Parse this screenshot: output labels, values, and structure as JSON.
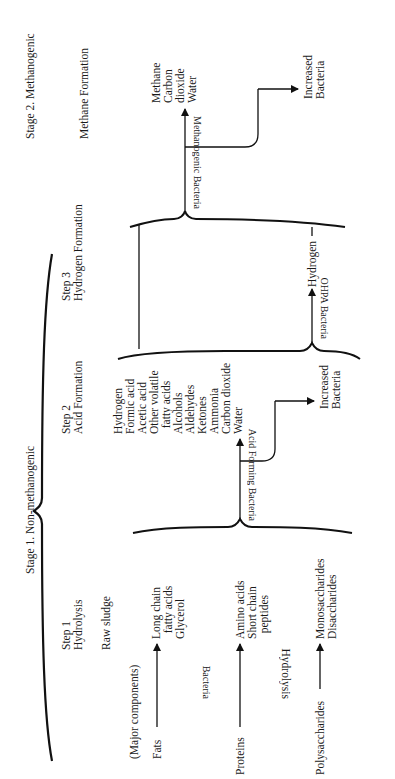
{
  "stages": {
    "stage1": "Stage 1. Non-methanogenic",
    "stage2": "Stage 2. Methanogenic"
  },
  "steps": {
    "step1": {
      "label": "Step 1",
      "name": "Hydrolysis"
    },
    "step2": {
      "label": "Step 2",
      "name": "Acid Formation"
    },
    "step3": {
      "label": "Step 3",
      "name": "Hydrogen Formation"
    },
    "methane": {
      "name": "Methane Formation"
    }
  },
  "inputs": {
    "raw_sludge": "Raw sludge",
    "major_components": "(Major components)",
    "fats": "Fats",
    "proteins": "Proteins",
    "polysaccharides": "Polysaccharides"
  },
  "hydrolysis_products": {
    "fats": "Long chain\n  fatty acids\nGlycerol",
    "proteins": "Amino acids\nShort chain\n  peptides",
    "polysaccharides": "Monosaccharides\nDisaccharides"
  },
  "hydrolysis_label": {
    "bacteria": "Bacteria",
    "hydrolysis": "Hydrolysis"
  },
  "acid_products": "Hydrogen\nFormic acid\nAcetic acid\nOther volatile\n  fatty acids\nAlcohols\nAldehydes\nKetones\nAmmonia\nCarbon dioxide\nWater",
  "bacteria_labels": {
    "acid_forming": "Acid Forming Bacteria",
    "ohpa": "OHPA Bacteria",
    "methanogenic": "Methanogenic Bacteria"
  },
  "hydrogen_output": "Hydrogen",
  "methane_products": "Methane\nCarbon\ndioxide\nWater",
  "increased_bacteria_1": "Increased\nBacteria",
  "increased_bacteria_2": "Increased\nBacteria"
}
